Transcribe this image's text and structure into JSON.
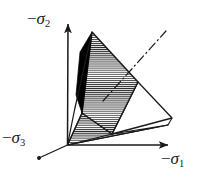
{
  "figure": {
    "background_color": "#ffffff",
    "line_color": "#1a1a1a",
    "fill_black_color": "#000000",
    "hatch_color": "#2b2b2b",
    "width": 210,
    "height": 178
  },
  "axes": {
    "origin": {
      "x": 67,
      "y": 145
    },
    "vertical": {
      "name": "sigma-2-axis",
      "label": "−σ",
      "subscript": "2",
      "minus": "−",
      "sigma": "σ",
      "direction": "up",
      "tip": {
        "x": 68,
        "y": 20
      }
    },
    "horizontal": {
      "name": "sigma-1-axis",
      "label": "−σ",
      "subscript": "1",
      "minus": "−",
      "sigma": "σ",
      "direction": "right",
      "tip": {
        "x": 173,
        "y": 145
      }
    },
    "oblique": {
      "name": "sigma-3-axis",
      "label": "−σ",
      "subscript": "3",
      "minus": "−",
      "sigma": "σ",
      "direction": "lower-left",
      "tip": {
        "x": 37,
        "y": 159
      }
    }
  },
  "hydrostatic_axis": {
    "name": "hydrostatic-axis",
    "style": "dash-dot",
    "from": {
      "x": 103,
      "y": 101
    },
    "to": {
      "x": 166,
      "y": 31
    }
  },
  "surface": {
    "apex": {
      "x": 67,
      "y": 145
    },
    "vertices": {
      "top": {
        "x": 92,
        "y": 32
      },
      "mid_right": {
        "x": 138,
        "y": 82
      },
      "far_right": {
        "x": 172,
        "y": 118
      },
      "lower_mid": {
        "x": 110,
        "y": 136
      },
      "left_edge_upper": {
        "x": 75,
        "y": 48
      },
      "left_edge_lower": {
        "x": 82,
        "y": 113
      }
    },
    "faces": [
      {
        "name": "main-hatched-face",
        "fill": "hatch-horizontal"
      },
      {
        "name": "black-sliver-face",
        "fill": "solid-black"
      },
      {
        "name": "right-white-face",
        "fill": "none"
      },
      {
        "name": "lower-hatched-face",
        "fill": "hatch-horizontal"
      }
    ]
  }
}
